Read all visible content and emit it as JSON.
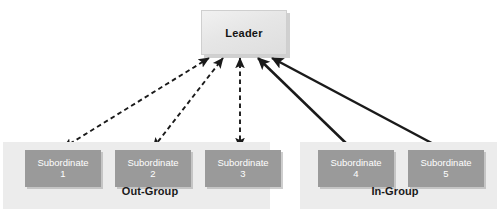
{
  "diagram": {
    "type": "node-link",
    "colors": {
      "leader_fill": "#e6e6e6",
      "subordinate_fill": "#9a9a9a",
      "panel_fill": "#ececec",
      "arrow": "#1a1a1a",
      "page_background": "#ffffff"
    }
  },
  "leader": {
    "label": "Leader",
    "x": 201,
    "y": 10,
    "w": 84,
    "h": 43
  },
  "groups": [
    {
      "id": "out-group",
      "label": "Out-Group",
      "link_style": "dashed",
      "link_direction": "bidirectional",
      "panel": {
        "x": 3,
        "y": 142,
        "w": 267,
        "h": 67
      },
      "members": [
        {
          "label": "Subordinate",
          "number": "1",
          "x": 25,
          "y": 150,
          "w": 76,
          "h": 37
        },
        {
          "label": "Subordinate",
          "number": "2",
          "x": 115,
          "y": 150,
          "w": 76,
          "h": 37
        },
        {
          "label": "Subordinate",
          "number": "3",
          "x": 205,
          "y": 150,
          "w": 76,
          "h": 37
        }
      ]
    },
    {
      "id": "in-group",
      "label": "In-Group",
      "link_style": "solid",
      "link_direction": "to-leader",
      "panel": {
        "x": 300,
        "y": 142,
        "w": 197,
        "h": 67
      },
      "members": [
        {
          "label": "Subordinate",
          "number": "4",
          "x": 318,
          "y": 150,
          "w": 76,
          "h": 37
        },
        {
          "label": "Subordinate",
          "number": "5",
          "x": 408,
          "y": 150,
          "w": 76,
          "h": 37
        }
      ]
    }
  ],
  "links": [
    {
      "from": "subordinate-1",
      "to": "leader",
      "style": "dashed",
      "arrowheads": "both"
    },
    {
      "from": "subordinate-2",
      "to": "leader",
      "style": "dashed",
      "arrowheads": "both"
    },
    {
      "from": "subordinate-3",
      "to": "leader",
      "style": "dashed",
      "arrowheads": "both"
    },
    {
      "from": "subordinate-4",
      "to": "leader",
      "style": "solid",
      "arrowheads": "end"
    },
    {
      "from": "subordinate-5",
      "to": "leader",
      "style": "solid",
      "arrowheads": "end"
    }
  ]
}
